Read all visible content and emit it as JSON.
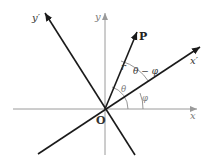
{
  "diagram": {
    "colors": {
      "original_axes": "#9a9a9a",
      "rotated_axes": "#1a1a1a",
      "arcs": "#8a8a8a",
      "angle_labels": "#7a7a7a",
      "text": "#222222"
    },
    "labels": {
      "x_axis": "x",
      "y_axis": "y",
      "x_prime_axis": "x′",
      "y_prime_axis": "y′",
      "point": "P",
      "origin": "O",
      "radius": "r",
      "theta": "θ",
      "phi": "φ",
      "theta_minus_phi": "θ − φ"
    }
  }
}
